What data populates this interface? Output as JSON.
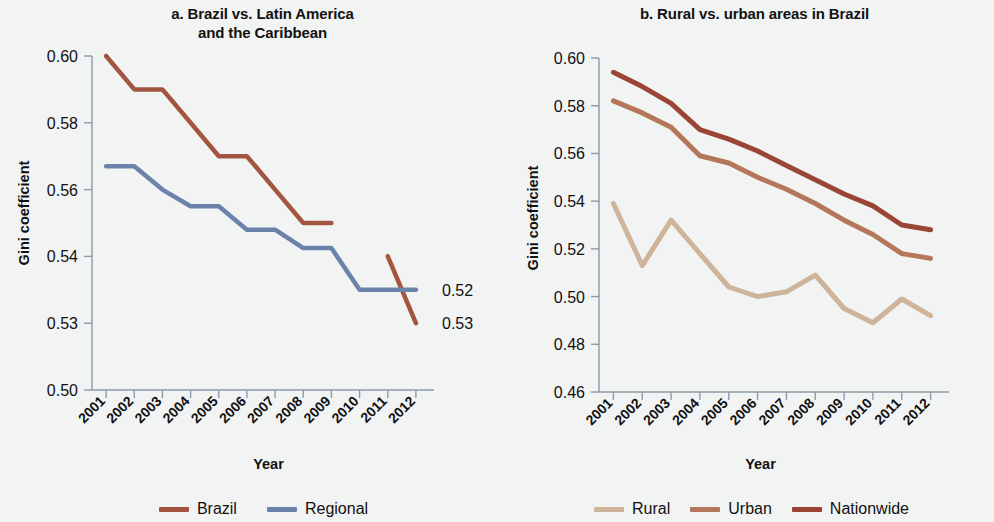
{
  "figure": {
    "background_color": "#f2f4f4"
  },
  "panels": [
    {
      "id": "a",
      "title": "a. Brazil vs. Latin America\nand the Caribbean",
      "title_line1": "a. Brazil vs. Latin America",
      "title_line2": "and the Caribbean",
      "xlabel": "Year",
      "ylabel": "Gini coefficient",
      "end_labels": [
        {
          "name": "brazil-end-label",
          "text": "0.53",
          "series": "Brazil"
        },
        {
          "name": "regional-end-label",
          "text": "0.52",
          "series": "Regional"
        }
      ],
      "legend": [
        {
          "label": "Brazil",
          "color": "#a4553f"
        },
        {
          "label": "Regional",
          "color": "#6b83ab"
        }
      ]
    },
    {
      "id": "b",
      "title": "b. Rural vs. urban areas in Brazil",
      "title_line1": "b. Rural vs. urban areas in Brazil",
      "title_line2": "",
      "xlabel": "Year",
      "ylabel": "Gini coefficient",
      "legend": [
        {
          "label": "Rural",
          "color": "#cdb49a"
        },
        {
          "label": "Urban",
          "color": "#b5775b"
        },
        {
          "label": "Nationwide",
          "color": "#9a4535"
        }
      ]
    }
  ],
  "chart_data": [
    {
      "type": "line",
      "panel": "a",
      "title": "a. Brazil vs. Latin America and the Caribbean",
      "xlabel": "Year",
      "ylabel": "Gini coefficient",
      "categories": [
        "2001",
        "2002",
        "2003",
        "2004",
        "2005",
        "2006",
        "2007",
        "2008",
        "2009",
        "2010",
        "2011",
        "2012"
      ],
      "ytick_labels": [
        "0.60",
        "0.58",
        "0.56",
        "0.54",
        "0.53",
        "0.50"
      ],
      "ytick_values": [
        0.6,
        0.58,
        0.56,
        0.54,
        0.53,
        0.5
      ],
      "ylim": [
        0.5,
        0.6
      ],
      "grid": false,
      "legend_position": "bottom",
      "series": [
        {
          "name": "Brazil",
          "color": "#a4553f",
          "values": [
            0.6,
            0.59,
            0.59,
            0.58,
            0.57,
            0.57,
            0.56,
            0.55,
            0.55,
            null,
            0.54,
            0.53
          ],
          "end_label": "0.53"
        },
        {
          "name": "Regional",
          "color": "#6b83ab",
          "values": [
            0.567,
            0.567,
            0.56,
            0.555,
            0.555,
            0.548,
            0.548,
            0.5425,
            0.5425,
            0.535,
            0.535,
            0.535
          ],
          "end_label": "0.52"
        }
      ]
    },
    {
      "type": "line",
      "panel": "b",
      "title": "b. Rural vs. urban areas in Brazil",
      "xlabel": "Year",
      "ylabel": "Gini coefficient",
      "categories": [
        "2001",
        "2002",
        "2003",
        "2004",
        "2005",
        "2006",
        "2007",
        "2008",
        "2009",
        "2010",
        "2011",
        "2012"
      ],
      "ytick_labels": [
        "0.60",
        "0.58",
        "0.56",
        "0.54",
        "0.52",
        "0.50",
        "0.48",
        "0.46"
      ],
      "ytick_values": [
        0.6,
        0.58,
        0.56,
        0.54,
        0.52,
        0.5,
        0.48,
        0.46
      ],
      "ylim": [
        0.46,
        0.6
      ],
      "grid": false,
      "legend_position": "bottom",
      "series": [
        {
          "name": "Rural",
          "color": "#cdb49a",
          "values": [
            0.539,
            0.513,
            0.532,
            0.518,
            0.504,
            0.5,
            0.502,
            0.509,
            0.495,
            0.489,
            0.499,
            0.492
          ]
        },
        {
          "name": "Urban",
          "color": "#b5775b",
          "values": [
            0.582,
            0.577,
            0.571,
            0.559,
            0.556,
            0.55,
            0.545,
            0.539,
            0.532,
            0.526,
            0.518,
            0.516
          ]
        },
        {
          "name": "Nationwide",
          "color": "#9a4535",
          "values": [
            0.594,
            0.588,
            0.581,
            0.57,
            0.566,
            0.561,
            0.555,
            0.549,
            0.543,
            0.538,
            0.53,
            0.528
          ]
        }
      ]
    }
  ]
}
